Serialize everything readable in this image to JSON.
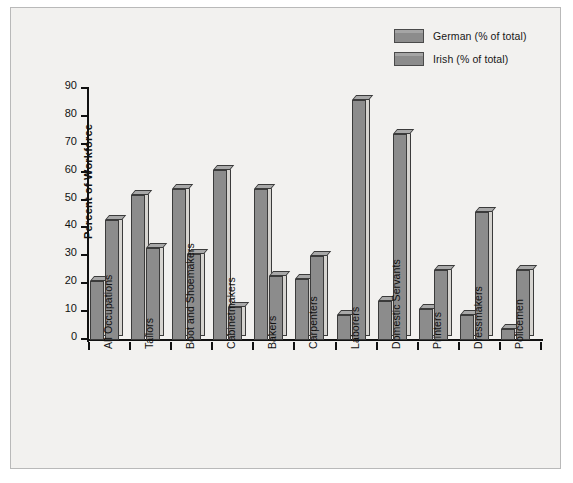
{
  "chart_data": {
    "type": "bar",
    "title": "",
    "xlabel": "",
    "ylabel": "Percent of Workforce",
    "ylim": [
      0,
      90
    ],
    "ytick_step": 10,
    "yticks": [
      90,
      80,
      70,
      60,
      50,
      40,
      30,
      20,
      10,
      0
    ],
    "grid": false,
    "legend_position": "top-right",
    "categories": [
      "All Occupations",
      "Tailors",
      "Boot and Shoemakers",
      "Cabinetmakers",
      "Bakers",
      "Carpenters",
      "Laborers",
      "Domestic Servants",
      "Printers",
      "Dressmakers",
      "Policemen"
    ],
    "series": [
      {
        "name": "German (% of total)",
        "color": "#8c8c8c",
        "values": [
          21,
          52,
          54,
          61,
          54,
          22,
          9,
          14,
          11,
          9,
          4
        ]
      },
      {
        "name": "Irish (% of total)",
        "color": "#8c8c8c",
        "values": [
          43,
          33,
          31,
          12,
          23,
          30,
          86,
          74,
          25,
          46,
          25
        ]
      }
    ]
  },
  "legend": {
    "items": [
      {
        "label": "German (% of total)"
      },
      {
        "label": "Irish (% of total)"
      }
    ]
  },
  "axes": {
    "y_axis_title": "Percent of Workforce"
  },
  "colors": {
    "bar_face": "#8c8c8c",
    "bar_top": "#a8a8a8",
    "bar_side": "#d6d4d0",
    "bar_outline": "#3b3b3b",
    "plot_background": "#f2f1ef",
    "frame_border": "#b9b9b9",
    "axis": "#111111",
    "text": "#111111"
  }
}
